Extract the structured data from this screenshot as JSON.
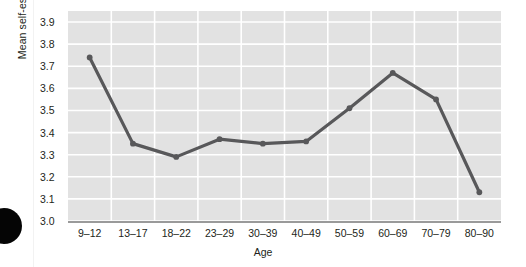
{
  "chart_data": {
    "type": "line",
    "title": "",
    "xlabel": "Age",
    "ylabel": "Mean self-esteem score",
    "categories": [
      "9–12",
      "13–17",
      "18–22",
      "23–29",
      "30–39",
      "40–49",
      "50–59",
      "60–69",
      "70–79",
      "80–90"
    ],
    "values": [
      3.74,
      3.35,
      3.29,
      3.37,
      3.35,
      3.36,
      3.51,
      3.67,
      3.55,
      3.13
    ],
    "series": [
      {
        "name": "Mean self-esteem score",
        "values": [
          3.74,
          3.35,
          3.29,
          3.37,
          3.35,
          3.36,
          3.51,
          3.67,
          3.55,
          3.13
        ]
      }
    ],
    "ylim": [
      3.0,
      3.95
    ],
    "yticks": [
      "3.0",
      "3.1",
      "3.2",
      "3.3",
      "3.4",
      "3.5",
      "3.6",
      "3.7",
      "3.8",
      "3.9"
    ],
    "ytick_values": [
      3.0,
      3.1,
      3.2,
      3.3,
      3.4,
      3.5,
      3.6,
      3.7,
      3.8,
      3.9
    ],
    "grid": true,
    "grid_color": "#ffffff",
    "plot_background": "#e2e2e2",
    "line_color": "#58585a",
    "marker_color": "#58585a",
    "legend": "none"
  },
  "artifacts": {
    "page_dot": "black-dot"
  }
}
